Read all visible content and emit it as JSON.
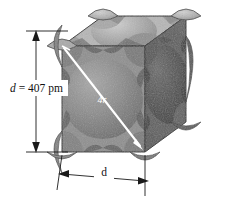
{
  "figure": {
    "background_color": "#ffffff"
  },
  "labels": {
    "edge_vertical": {
      "symbol": "d",
      "equals": " = ",
      "value": "407",
      "unit": " pm",
      "full_text": "d = 407 pm"
    },
    "edge_horizontal": {
      "symbol": "d",
      "full_text": "d"
    },
    "diagonal": {
      "symbol": "4r",
      "full_text": "4r"
    }
  },
  "colors": {
    "top_face": "#b6b6b6",
    "front_face": "#8e8e8e",
    "right_face": "#5e5e5e",
    "top_sphere": "#a3a3a3",
    "front_sphere": "#828282",
    "right_sphere": "#4f4f4f",
    "outline": "#2b2b2b",
    "dimension_line": "#1a1a1a",
    "diagonal_arrow": "#ffffff",
    "label_text": "#111111"
  },
  "geometry": {
    "cube_front_top_left": [
      62,
      46
    ],
    "cube_front_top_right": [
      145,
      46
    ],
    "cube_front_bottom_left": [
      62,
      152
    ],
    "cube_front_bottom_right": [
      145,
      152
    ],
    "cube_back_top_left": [
      103,
      16
    ],
    "cube_back_top_right": [
      186,
      16
    ],
    "cube_back_bottom_right": [
      186,
      122
    ],
    "diagonal_start": [
      64,
      48
    ],
    "diagonal_end": [
      143,
      150
    ],
    "vertical_dim_x": 36,
    "vertical_dim_top_y": 31,
    "vertical_dim_bottom_y": 152,
    "horizontal_dim_left": [
      61,
      175
    ],
    "horizontal_dim_right": [
      146,
      182
    ]
  }
}
